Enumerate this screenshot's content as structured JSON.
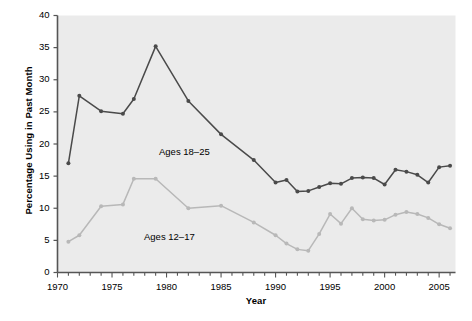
{
  "chart_data": {
    "type": "line",
    "title": "",
    "xlabel": "Year",
    "ylabel": "Percentage Using in Past Month",
    "xlim": [
      1970,
      2006.5
    ],
    "ylim": [
      0,
      40
    ],
    "xticks": [
      1970,
      1975,
      1980,
      1985,
      1990,
      1995,
      2000,
      2005
    ],
    "yticks": [
      0,
      5,
      10,
      15,
      20,
      25,
      30,
      35,
      40
    ],
    "grid": false,
    "legend_position": "inline-annotations",
    "plot_background": "#ebebeb",
    "series": [
      {
        "name": "Ages 18-25",
        "label": "Ages 18–25",
        "color": "#4a4a4a",
        "x": [
          1971,
          1972,
          1974,
          1976,
          1977,
          1979,
          1982,
          1985,
          1988,
          1990,
          1991,
          1992,
          1993,
          1994,
          1995,
          1996,
          1997,
          1998,
          1999,
          2000,
          2001,
          2002,
          2003,
          2004,
          2005,
          2006
        ],
        "values": [
          17.0,
          27.5,
          25.1,
          24.7,
          27.0,
          35.2,
          26.7,
          21.5,
          17.5,
          14.0,
          14.4,
          12.6,
          12.7,
          13.3,
          13.9,
          13.8,
          14.7,
          14.8,
          14.7,
          13.7,
          16.0,
          15.7,
          15.2,
          14.0,
          16.4,
          16.6
        ]
      },
      {
        "name": "Ages 12-17",
        "label": "Ages 12–17",
        "color": "#b8b8b8",
        "x": [
          1971,
          1972,
          1974,
          1976,
          1977,
          1979,
          1982,
          1985,
          1988,
          1990,
          1991,
          1992,
          1993,
          1994,
          1995,
          1996,
          1997,
          1998,
          1999,
          2000,
          2001,
          2002,
          2003,
          2004,
          2005,
          2006
        ],
        "values": [
          4.8,
          5.8,
          10.3,
          10.6,
          14.6,
          14.6,
          10.0,
          10.4,
          7.8,
          5.8,
          4.5,
          3.6,
          3.4,
          6.0,
          9.1,
          7.6,
          10.0,
          8.3,
          8.1,
          8.2,
          9.0,
          9.4,
          9.1,
          8.5,
          7.5,
          6.9
        ]
      }
    ]
  },
  "axes": {
    "y_tick_labels": [
      "0",
      "5",
      "10",
      "15",
      "20",
      "25",
      "30",
      "35",
      "40"
    ],
    "x_tick_labels": [
      "1970",
      "1975",
      "1980",
      "1985",
      "1990",
      "1995",
      "2000",
      "2005"
    ]
  }
}
